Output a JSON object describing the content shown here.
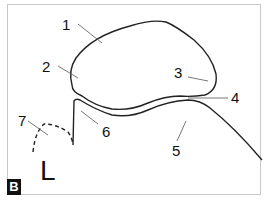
{
  "figure": {
    "panel_label": "B",
    "side_marker": "L",
    "labels": [
      {
        "id": "1",
        "text": "1"
      },
      {
        "id": "2",
        "text": "2"
      },
      {
        "id": "3",
        "text": "3"
      },
      {
        "id": "4",
        "text": "4"
      },
      {
        "id": "5",
        "text": "5"
      },
      {
        "id": "6",
        "text": "6"
      },
      {
        "id": "7",
        "text": "7"
      }
    ],
    "colors": {
      "outline": "#222222",
      "shade": "#d6d6d6",
      "frame": "#c8c8c8",
      "badge_bg": "#111111",
      "badge_fg": "#ffffff"
    }
  }
}
